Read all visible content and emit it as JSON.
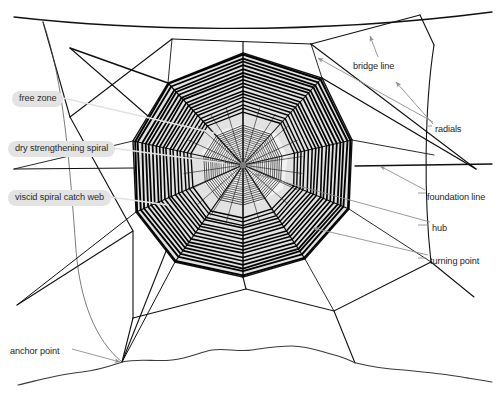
{
  "figure": {
    "background_color": "#ffffff",
    "width": 503,
    "height": 395
  },
  "colors": {
    "web_line": "#111111",
    "spiral_line": "#000000",
    "catch_web_fill": "#e0e0e0",
    "hub_fill": "#d8d8d8",
    "leader_gray": "#9a9a9a",
    "leader_light": "#e8e8e8",
    "pill_background": "#e3e3e3",
    "label_text": "#262626",
    "ground_line": "#3a3a3a"
  },
  "labels": {
    "left": [
      {
        "id": "free-zone",
        "text": "free zone",
        "x": 12,
        "y": 91
      },
      {
        "id": "dry-strengthening-spiral",
        "text": "dry strengthening spiral",
        "x": 8,
        "y": 141
      },
      {
        "id": "viscid-spiral-catch-web",
        "text": "viscid spiral catch web",
        "x": 8,
        "y": 190
      },
      {
        "id": "anchor-point",
        "text": "anchor point",
        "x": 10,
        "y": 346,
        "style": "plain"
      }
    ],
    "right": [
      {
        "id": "bridge-line",
        "text": "bridge line",
        "x": 353,
        "y": 61
      },
      {
        "id": "radials",
        "text": "radials",
        "x": 435,
        "y": 124
      },
      {
        "id": "foundation-line",
        "text": "foundation line",
        "x": 427,
        "y": 192
      },
      {
        "id": "hub",
        "text": "hub",
        "x": 432,
        "y": 223
      },
      {
        "id": "turning-point",
        "text": "turning point",
        "x": 430,
        "y": 256
      }
    ]
  },
  "web_geometry": {
    "hub_center": {
      "x": 243,
      "y": 165
    },
    "radial_count": 12,
    "spiral_ring_count": 17,
    "hub_ring_count": 10,
    "outer_radius": 112,
    "free_zone_inner_radius": 38,
    "catch_web_inner_radius": 46
  },
  "parts": [
    "bridge line",
    "radials",
    "foundation line",
    "hub",
    "turning point",
    "free zone",
    "dry strengthening spiral",
    "viscid spiral catch web",
    "anchor point"
  ]
}
